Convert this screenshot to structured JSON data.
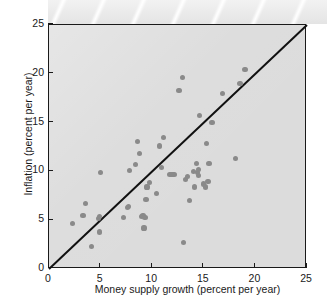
{
  "figure": {
    "background_color": "#ffffff",
    "plot_background_color": "#dcdcdc",
    "point_color": "#8a8a8a",
    "axis_color": "#1a1a1a",
    "banner": {
      "name": "decorative-striped-banner",
      "stripe_count": 7,
      "base_color": "#e9e9e9",
      "stripe_color": "#ffffff"
    }
  },
  "chart_data": {
    "type": "scatter",
    "title": "",
    "xlabel": "Money supply growth (percent per year)",
    "ylabel": "Inflation (percent per year)",
    "xlim": [
      0,
      25
    ],
    "ylim": [
      0,
      25
    ],
    "xticks": [
      0,
      5,
      10,
      15,
      20,
      25
    ],
    "yticks": [
      0,
      5,
      10,
      15,
      20,
      25
    ],
    "xticklabels": [
      "0",
      "5",
      "10",
      "15",
      "20",
      "25"
    ],
    "yticklabels": [
      "0",
      "5",
      "10",
      "15",
      "20",
      "25"
    ],
    "grid": false,
    "legend": null,
    "annotations": [],
    "reference_line": {
      "name": "45-degree-line",
      "description": "45-degree line where inflation equals money supply growth",
      "from": [
        0,
        0
      ],
      "to": [
        25,
        25
      ],
      "color": "#111111",
      "width_px": 2
    },
    "points": [
      {
        "x": 2.3,
        "y": 4.7
      },
      {
        "x": 3.3,
        "y": 5.5
      },
      {
        "x": 3.5,
        "y": 6.7
      },
      {
        "x": 4.1,
        "y": 2.3
      },
      {
        "x": 4.8,
        "y": 5.2
      },
      {
        "x": 4.9,
        "y": 5.4
      },
      {
        "x": 4.9,
        "y": 3.8
      },
      {
        "x": 5.0,
        "y": 9.9
      },
      {
        "x": 7.2,
        "y": 5.3
      },
      {
        "x": 7.6,
        "y": 6.3
      },
      {
        "x": 7.7,
        "y": 6.4
      },
      {
        "x": 7.8,
        "y": 10.1
      },
      {
        "x": 8.4,
        "y": 10.7
      },
      {
        "x": 8.6,
        "y": 13.1
      },
      {
        "x": 8.8,
        "y": 11.8
      },
      {
        "x": 9.0,
        "y": 5.4
      },
      {
        "x": 9.1,
        "y": 5.5
      },
      {
        "x": 9.2,
        "y": 4.2
      },
      {
        "x": 9.3,
        "y": 5.3
      },
      {
        "x": 9.4,
        "y": 7.1
      },
      {
        "x": 9.5,
        "y": 8.4
      },
      {
        "x": 9.7,
        "y": 8.9
      },
      {
        "x": 10.4,
        "y": 7.7
      },
      {
        "x": 10.7,
        "y": 12.6
      },
      {
        "x": 10.9,
        "y": 10.4
      },
      {
        "x": 11.1,
        "y": 13.5
      },
      {
        "x": 11.9,
        "y": 9.7,
        "merged_pair": true
      },
      {
        "x": 12.6,
        "y": 18.3
      },
      {
        "x": 12.9,
        "y": 19.6
      },
      {
        "x": 13.0,
        "y": 2.7
      },
      {
        "x": 13.2,
        "y": 9.2
      },
      {
        "x": 13.4,
        "y": 9.5
      },
      {
        "x": 13.6,
        "y": 7.0
      },
      {
        "x": 14.0,
        "y": 10.0
      },
      {
        "x": 14.1,
        "y": 8.4
      },
      {
        "x": 14.3,
        "y": 10.8
      },
      {
        "x": 14.4,
        "y": 9.9
      },
      {
        "x": 14.5,
        "y": 9.6
      },
      {
        "x": 14.5,
        "y": 10.2
      },
      {
        "x": 14.6,
        "y": 15.7
      },
      {
        "x": 15.0,
        "y": 8.7
      },
      {
        "x": 15.2,
        "y": 8.4
      },
      {
        "x": 15.3,
        "y": 12.9
      },
      {
        "x": 15.4,
        "y": 9.0
      },
      {
        "x": 15.5,
        "y": 10.8
      },
      {
        "x": 15.8,
        "y": 15.0
      },
      {
        "x": 16.8,
        "y": 18.0
      },
      {
        "x": 18.1,
        "y": 11.3
      },
      {
        "x": 18.5,
        "y": 19.0
      },
      {
        "x": 19.0,
        "y": 20.4
      }
    ]
  }
}
